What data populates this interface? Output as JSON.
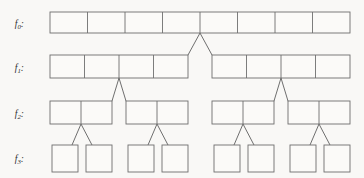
{
  "diagram": {
    "background_color": "#f9f8f6",
    "line_color": "#6e6e6e",
    "cell_fill_color": "#fbfaf8",
    "levels": [
      {
        "id": "f0",
        "label": "f",
        "subscript": "0",
        "colon": ":",
        "label_text": "f0:",
        "cell_count": 8,
        "block_count": 1,
        "blocks": [
          {
            "index": 0,
            "cells": 8,
            "x": 50,
            "width": 300
          }
        ],
        "y": 12,
        "height": 21
      },
      {
        "id": "f1",
        "label": "f",
        "subscript": "1",
        "colon": ":",
        "label_text": "f1:",
        "cell_count": 8,
        "block_count": 2,
        "blocks": [
          {
            "index": 0,
            "cells": 4,
            "x": 50,
            "width": 138
          },
          {
            "index": 1,
            "cells": 4,
            "x": 212,
            "width": 138
          }
        ],
        "y": 55,
        "height": 23
      },
      {
        "id": "f2",
        "label": "f",
        "subscript": "2",
        "colon": ":",
        "label_text": "f2:",
        "cell_count": 8,
        "block_count": 4,
        "blocks": [
          {
            "index": 0,
            "cells": 2,
            "x": 50,
            "width": 62
          },
          {
            "index": 1,
            "cells": 2,
            "x": 126,
            "width": 62
          },
          {
            "index": 2,
            "cells": 2,
            "x": 212,
            "width": 62
          },
          {
            "index": 3,
            "cells": 2,
            "x": 288,
            "width": 62
          }
        ],
        "y": 101,
        "height": 23
      },
      {
        "id": "f3",
        "label": "f",
        "subscript": "3",
        "colon": ":",
        "label_text": "f3:",
        "cell_count": 8,
        "block_count": 8,
        "blocks": [
          {
            "index": 0,
            "cells": 1,
            "x": 52,
            "width": 26
          },
          {
            "index": 1,
            "cells": 1,
            "x": 86,
            "width": 26
          },
          {
            "index": 2,
            "cells": 1,
            "x": 128,
            "width": 26
          },
          {
            "index": 3,
            "cells": 1,
            "x": 162,
            "width": 26
          },
          {
            "index": 4,
            "cells": 1,
            "x": 214,
            "width": 26
          },
          {
            "index": 5,
            "cells": 1,
            "x": 248,
            "width": 26
          },
          {
            "index": 6,
            "cells": 1,
            "x": 290,
            "width": 26
          },
          {
            "index": 7,
            "cells": 1,
            "x": 324,
            "width": 26
          }
        ],
        "y": 145,
        "height": 27
      }
    ],
    "connectors": [
      {
        "id": "c0",
        "from_level": "f0",
        "to_level": "f1",
        "apex_x": 200,
        "apex_y": 33,
        "left_x": 188,
        "right_x": 212,
        "base_y": 55
      },
      {
        "id": "c1",
        "from_level": "f1",
        "to_level": "f2",
        "apex_x": 119,
        "apex_y": 78,
        "left_x": 112,
        "right_x": 126,
        "base_y": 101
      },
      {
        "id": "c2",
        "from_level": "f1",
        "to_level": "f2",
        "apex_x": 281,
        "apex_y": 78,
        "left_x": 274,
        "right_x": 288,
        "base_y": 101
      },
      {
        "id": "c3",
        "from_level": "f2",
        "to_level": "f3",
        "apex_x": 81,
        "apex_y": 124,
        "left_x": 72,
        "right_x": 92,
        "base_y": 145
      },
      {
        "id": "c4",
        "from_level": "f2",
        "to_level": "f3",
        "apex_x": 157,
        "apex_y": 124,
        "left_x": 148,
        "right_x": 168,
        "base_y": 145
      },
      {
        "id": "c5",
        "from_level": "f2",
        "to_level": "f3",
        "apex_x": 243,
        "apex_y": 124,
        "left_x": 234,
        "right_x": 254,
        "base_y": 145
      },
      {
        "id": "c6",
        "from_level": "f2",
        "to_level": "f3",
        "apex_x": 319,
        "apex_y": 124,
        "left_x": 310,
        "right_x": 330,
        "base_y": 145
      }
    ],
    "label_x": 24,
    "label_positions": [
      27,
      71,
      117,
      162
    ]
  }
}
